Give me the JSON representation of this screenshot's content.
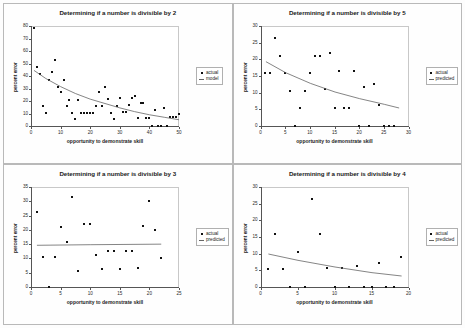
{
  "figure": {
    "layout": "2x2 grid of scatter plots",
    "panel_count": 4
  },
  "common": {
    "xlabel": "opportunity to demonstrate skill",
    "ylabel": "percent error",
    "legend_actual": "actual",
    "legend_predicted": "predicted",
    "legend_model": "model",
    "marker_color": "#111111",
    "line_color": "#666666"
  },
  "chart_data": [
    {
      "type": "scatter",
      "panel": 1,
      "title": "Determining if a number is divisible by 2",
      "xlabel": "opportunity to demonstrate skill",
      "ylabel": "percent error",
      "xlim": [
        0,
        50
      ],
      "ylim": [
        0,
        80
      ],
      "xticks": [
        0,
        10,
        20,
        30,
        40,
        50
      ],
      "yticks": [
        0,
        10,
        20,
        30,
        40,
        50,
        60,
        70,
        80
      ],
      "grid": false,
      "legend_position": "right",
      "legend": [
        "actual",
        "model"
      ],
      "series": [
        {
          "name": "actual",
          "style": "markers",
          "points": [
            [
              1,
              78.5
            ],
            [
              2,
              47.5
            ],
            [
              3,
              42.0
            ],
            [
              4,
              16.0
            ],
            [
              5,
              10.5
            ],
            [
              6,
              37.0
            ],
            [
              7,
              43.0
            ],
            [
              8,
              52.5
            ],
            [
              9,
              31.0
            ],
            [
              10,
              27.0
            ],
            [
              11,
              37.0
            ],
            [
              12,
              16.0
            ],
            [
              13,
              21.0
            ],
            [
              14,
              10.5
            ],
            [
              15,
              5.5
            ],
            [
              16,
              21.0
            ],
            [
              17,
              10.5
            ],
            [
              18,
              10.5
            ],
            [
              19,
              10.5
            ],
            [
              20,
              10.5
            ],
            [
              21,
              10.5
            ],
            [
              22,
              16.0
            ],
            [
              23,
              27.0
            ],
            [
              24,
              16.0
            ],
            [
              25,
              31.5
            ],
            [
              26,
              21.5
            ],
            [
              27,
              10.5
            ],
            [
              28,
              5.5
            ],
            [
              29,
              16.0
            ],
            [
              30,
              22.5
            ],
            [
              31,
              11.0
            ],
            [
              32,
              11.0
            ],
            [
              33,
              16.5
            ],
            [
              34,
              22.5
            ],
            [
              35,
              24.0
            ],
            [
              36,
              6.5
            ],
            [
              37,
              18.5
            ],
            [
              38,
              18.5
            ],
            [
              39,
              6.5
            ],
            [
              40,
              6.5
            ],
            [
              41,
              0.0
            ],
            [
              42,
              12.5
            ],
            [
              43,
              0.0
            ],
            [
              44,
              0.0
            ],
            [
              45,
              14.5
            ],
            [
              46,
              0.0
            ],
            [
              47,
              7.5
            ],
            [
              48,
              7.5
            ],
            [
              49,
              7.5
            ],
            [
              50,
              10.0
            ]
          ]
        },
        {
          "name": "model",
          "style": "line",
          "curve": "power/exponential decay",
          "points": [
            [
              1,
              44.5
            ],
            [
              5,
              38.0
            ],
            [
              10,
              31.5
            ],
            [
              15,
              26.0
            ],
            [
              20,
              21.5
            ],
            [
              25,
              18.0
            ],
            [
              30,
              14.5
            ],
            [
              35,
              11.5
            ],
            [
              40,
              9.0
            ],
            [
              45,
              7.0
            ],
            [
              50,
              5.0
            ]
          ]
        }
      ]
    },
    {
      "type": "scatter",
      "panel": 2,
      "title": "Determining if a number is divisible by 5",
      "xlabel": "opportunity to demonstrate skill",
      "ylabel": "percent error",
      "xlim": [
        0,
        30
      ],
      "ylim": [
        0,
        30
      ],
      "xticks": [
        0,
        5,
        10,
        15,
        20,
        25,
        30
      ],
      "yticks": [
        0,
        5,
        10,
        15,
        20,
        25,
        30
      ],
      "grid": false,
      "legend_position": "right",
      "legend": [
        "actual",
        "predicted"
      ],
      "series": [
        {
          "name": "actual",
          "style": "markers",
          "points": [
            [
              1,
              15.8
            ],
            [
              2,
              15.8
            ],
            [
              3,
              26.3
            ],
            [
              4,
              21.0
            ],
            [
              5,
              15.8
            ],
            [
              6,
              10.5
            ],
            [
              7,
              0.0
            ],
            [
              8,
              5.3
            ],
            [
              9,
              10.5
            ],
            [
              10,
              15.8
            ],
            [
              11,
              21.0
            ],
            [
              12,
              21.0
            ],
            [
              13,
              11.0
            ],
            [
              14,
              22.0
            ],
            [
              15,
              5.5
            ],
            [
              16,
              16.5
            ],
            [
              17,
              5.5
            ],
            [
              18,
              5.5
            ],
            [
              19,
              16.5
            ],
            [
              20,
              0.0
            ],
            [
              21,
              11.8
            ],
            [
              22,
              0.0
            ],
            [
              23,
              12.5
            ],
            [
              24,
              6.2
            ],
            [
              25,
              0.0
            ],
            [
              26,
              0.0
            ],
            [
              27,
              0.0
            ]
          ]
        },
        {
          "name": "predicted",
          "style": "line",
          "curve": "power/exponential decay",
          "points": [
            [
              1,
              19.3
            ],
            [
              5,
              16.0
            ],
            [
              10,
              12.8
            ],
            [
              15,
              10.2
            ],
            [
              20,
              8.2
            ],
            [
              25,
              6.5
            ],
            [
              28,
              5.4
            ]
          ]
        }
      ]
    },
    {
      "type": "scatter",
      "panel": 3,
      "title": "Determining if a number is divisible by 3",
      "xlabel": "opportunity to demonstrate skill",
      "ylabel": "percent error",
      "xlim": [
        0,
        25
      ],
      "ylim": [
        0,
        35
      ],
      "xticks": [
        0,
        5,
        10,
        15,
        20,
        25
      ],
      "yticks": [
        0,
        5,
        10,
        15,
        20,
        25,
        30,
        35
      ],
      "grid": false,
      "legend_position": "right",
      "legend": [
        "actual",
        "predicted"
      ],
      "series": [
        {
          "name": "actual",
          "style": "markers",
          "points": [
            [
              1,
              26.3
            ],
            [
              2,
              10.5
            ],
            [
              3,
              0.0
            ],
            [
              4,
              10.5
            ],
            [
              5,
              21.0
            ],
            [
              6,
              15.8
            ],
            [
              7,
              31.6
            ],
            [
              8,
              5.6
            ],
            [
              9,
              22.2
            ],
            [
              10,
              22.2
            ],
            [
              11,
              11.1
            ],
            [
              12,
              6.2
            ],
            [
              13,
              12.5
            ],
            [
              14,
              12.5
            ],
            [
              15,
              6.2
            ],
            [
              16,
              12.5
            ],
            [
              17,
              12.5
            ],
            [
              18,
              6.7
            ],
            [
              19,
              21.4
            ],
            [
              20,
              30.0
            ],
            [
              21,
              20.0
            ],
            [
              22,
              10.0
            ]
          ]
        },
        {
          "name": "predicted",
          "style": "line",
          "curve": "nearly flat",
          "points": [
            [
              1,
              14.6
            ],
            [
              10,
              14.8
            ],
            [
              22,
              15.0
            ]
          ]
        }
      ]
    },
    {
      "type": "scatter",
      "panel": 4,
      "title": "Determining if a number is divisible by 4",
      "xlabel": "opportunity to demonstrate skill",
      "ylabel": "percent error",
      "xlim": [
        0,
        20
      ],
      "ylim": [
        0,
        30
      ],
      "xticks": [
        0,
        5,
        10,
        15,
        20
      ],
      "yticks": [
        0,
        5,
        10,
        15,
        20,
        25,
        30
      ],
      "grid": false,
      "legend_position": "right",
      "legend": [
        "actual",
        "predicted"
      ],
      "series": [
        {
          "name": "actual",
          "style": "markers",
          "points": [
            [
              1,
              5.3
            ],
            [
              2,
              15.8
            ],
            [
              3,
              5.3
            ],
            [
              4,
              0.0
            ],
            [
              5,
              10.5
            ],
            [
              6,
              0.0
            ],
            [
              7,
              26.3
            ],
            [
              8,
              15.8
            ],
            [
              9,
              5.8
            ],
            [
              10,
              0.0
            ],
            [
              11,
              5.8
            ],
            [
              12,
              0.0
            ],
            [
              13,
              6.2
            ],
            [
              14,
              0.0
            ],
            [
              15,
              0.0
            ],
            [
              16,
              7.1
            ],
            [
              17,
              0.0
            ],
            [
              18,
              0.0
            ],
            [
              19,
              9.0
            ]
          ]
        },
        {
          "name": "predicted",
          "style": "line",
          "curve": "power/exponential decay",
          "points": [
            [
              1,
              9.9
            ],
            [
              5,
              8.0
            ],
            [
              10,
              6.0
            ],
            [
              15,
              4.3
            ],
            [
              19,
              3.3
            ]
          ]
        }
      ]
    }
  ]
}
